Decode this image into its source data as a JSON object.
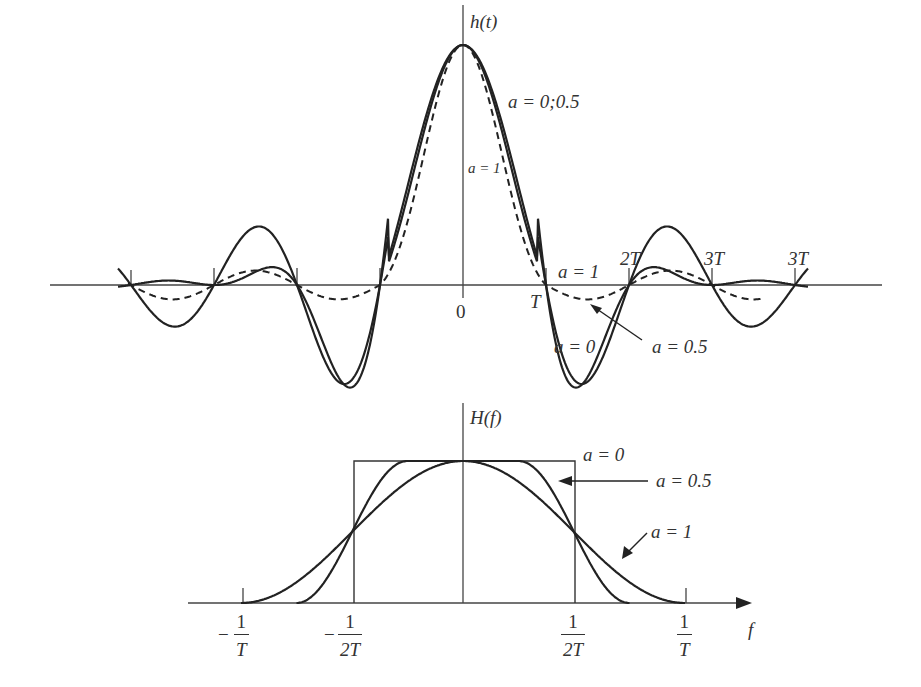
{
  "chart_data": [
    {
      "type": "line",
      "title": "",
      "ylabel": "h(t)",
      "xlabel": "",
      "description": "Raised-cosine impulse response h(t) for roll-off factors a = 0, 0.5, 1",
      "x_ticks": [
        "-4T",
        "-3T",
        "-2T",
        "-T",
        "0",
        "T",
        "2T",
        "3T",
        "4T"
      ],
      "tick_labels_shown": [
        "0",
        "T",
        "2T",
        "3T",
        "3T"
      ],
      "series": [
        {
          "name": "a = 0",
          "style": "solid",
          "zero_crossings": [
            "±T",
            "±2T",
            "±3T",
            "±4T"
          ],
          "peak": 1.0
        },
        {
          "name": "a = 0.5",
          "style": "solid",
          "zero_crossings": [
            "±T",
            "±2T",
            "±3T",
            "±4T"
          ],
          "peak": 1.0
        },
        {
          "name": "a = 1",
          "style": "dashed",
          "zero_crossings": [
            "±T",
            "±1.5T",
            "±2T",
            "±3T"
          ],
          "peak": 1.0
        }
      ],
      "annotations": [
        "a = 0;0.5",
        "a = 1",
        "a = 1",
        "a = 0",
        "a = 0.5"
      ]
    },
    {
      "type": "line",
      "title": "",
      "ylabel": "H(f)",
      "xlabel": "f",
      "description": "Raised-cosine spectrum H(f) for roll-off factors a = 0, 0.5, 1",
      "x_ticks": [
        "-1/T",
        "-1/(2T)",
        "1/(2T)",
        "1/T"
      ],
      "series": [
        {
          "name": "a = 0",
          "shape": "rectangle",
          "band_edges": [
            "-1/(2T)",
            "1/(2T)"
          ],
          "level": 1.0
        },
        {
          "name": "a = 0.5",
          "shape": "raised-cosine",
          "flat_to": "±1/(4T)",
          "zero_at": "±3/(4T)",
          "half_at": "±1/(2T)"
        },
        {
          "name": "a = 1",
          "shape": "raised-cosine",
          "flat_to": "0",
          "zero_at": "±1/T",
          "half_at": "±1/(2T)"
        }
      ],
      "annotations": [
        "a = 0",
        "a = 0.5",
        "a = 1"
      ]
    }
  ],
  "top": {
    "ylabel": "h(t)",
    "label_a0_05": "a = 0;0.5",
    "label_a1_center": "a = 1",
    "label_a1_right": "a = 1",
    "label_a0": "a = 0",
    "label_a05": "a = 0.5",
    "tick_0": "0",
    "tick_T": "T",
    "tick_2T": "2T",
    "tick_3T_a": "3T",
    "tick_3T_b": "3T"
  },
  "bottom": {
    "ylabel": "H(f)",
    "xlabel": "f",
    "label_a0": "a = 0",
    "label_a05": "a = 0.5",
    "label_a1": "a = 1",
    "tick_neg_1_T": {
      "sign": "−",
      "num": "1",
      "den": "T"
    },
    "tick_neg_1_2T": {
      "sign": "−",
      "num": "1",
      "den": "2T"
    },
    "tick_1_2T": {
      "num": "1",
      "den": "2T"
    },
    "tick_1_T": {
      "num": "1",
      "den": "T"
    }
  }
}
